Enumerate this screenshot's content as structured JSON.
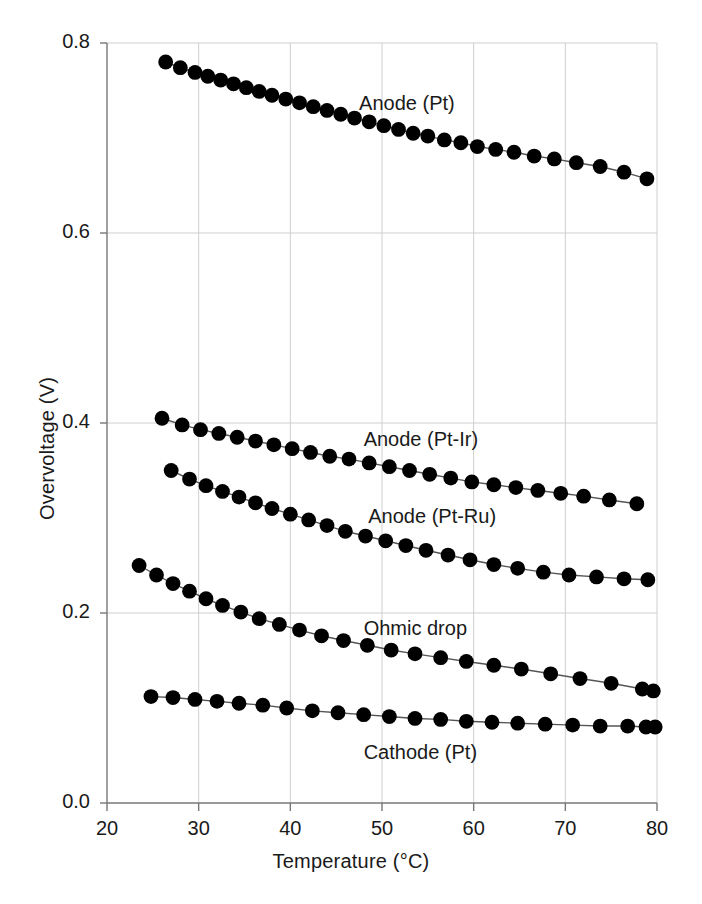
{
  "figure": {
    "background": "#ffffff",
    "marker_color": "#000000",
    "line_color": "#555555",
    "grid_color": "#cfcfcf",
    "axis_color": "#777777"
  },
  "chart_data": {
    "type": "line",
    "title": "",
    "xlabel": "Temperature (°C)",
    "ylabel": "Overvoltage (V)",
    "xlim": [
      20,
      80
    ],
    "ylim": [
      0.0,
      0.8
    ],
    "xticks": [
      20,
      30,
      40,
      50,
      60,
      70,
      80
    ],
    "xtick_labels": [
      "20",
      "30",
      "40",
      "50",
      "60",
      "70",
      "80"
    ],
    "yticks": [
      0.0,
      0.2,
      0.4,
      0.6,
      0.8
    ],
    "ytick_labels": [
      "0.0",
      "0.2",
      "0.4",
      "0.6",
      "0.8"
    ],
    "grid": true,
    "legend": "inline-annotations",
    "marker": "filled-circle",
    "series": [
      {
        "name": "Anode (Pt)",
        "label_x": 47.5,
        "label_y": 0.735,
        "x": [
          26.4,
          28.0,
          29.6,
          31.0,
          32.4,
          33.8,
          35.2,
          36.6,
          38.0,
          39.5,
          41.0,
          42.5,
          44.0,
          45.5,
          47.0,
          48.6,
          50.2,
          51.8,
          53.4,
          55.0,
          56.8,
          58.6,
          60.4,
          62.4,
          64.4,
          66.6,
          68.8,
          71.2,
          73.8,
          76.4,
          78.9
        ],
        "y": [
          0.78,
          0.774,
          0.769,
          0.765,
          0.761,
          0.757,
          0.753,
          0.749,
          0.745,
          0.741,
          0.737,
          0.733,
          0.729,
          0.725,
          0.721,
          0.717,
          0.713,
          0.709,
          0.705,
          0.702,
          0.698,
          0.695,
          0.691,
          0.688,
          0.685,
          0.681,
          0.678,
          0.674,
          0.67,
          0.664,
          0.657
        ]
      },
      {
        "name": "Anode (Pt-Ir)",
        "label_x": 48.0,
        "label_y": 0.381,
        "x": [
          26.0,
          28.2,
          30.2,
          32.2,
          34.2,
          36.2,
          38.2,
          40.2,
          42.2,
          44.3,
          46.4,
          48.6,
          50.8,
          53.0,
          55.2,
          57.5,
          59.8,
          62.2,
          64.6,
          67.0,
          69.5,
          72.0,
          74.8,
          77.8
        ],
        "y": [
          0.405,
          0.398,
          0.393,
          0.389,
          0.385,
          0.381,
          0.377,
          0.373,
          0.369,
          0.365,
          0.362,
          0.358,
          0.354,
          0.35,
          0.346,
          0.342,
          0.338,
          0.335,
          0.332,
          0.329,
          0.326,
          0.323,
          0.319,
          0.315
        ]
      },
      {
        "name": "Anode (Pt-Ru)",
        "label_x": 48.5,
        "label_y": 0.3,
        "x": [
          27.0,
          29.0,
          30.8,
          32.6,
          34.4,
          36.2,
          38.0,
          40.0,
          42.0,
          44.0,
          46.0,
          48.2,
          50.4,
          52.6,
          54.8,
          57.2,
          59.6,
          62.2,
          64.8,
          67.6,
          70.4,
          73.4,
          76.4,
          79.0
        ],
        "y": [
          0.35,
          0.341,
          0.334,
          0.328,
          0.322,
          0.316,
          0.31,
          0.304,
          0.298,
          0.292,
          0.286,
          0.281,
          0.276,
          0.271,
          0.266,
          0.261,
          0.256,
          0.251,
          0.247,
          0.243,
          0.24,
          0.238,
          0.236,
          0.235
        ]
      },
      {
        "name": "Ohmic drop",
        "label_x": 48.0,
        "label_y": 0.182,
        "x": [
          23.5,
          25.4,
          27.2,
          29.0,
          30.8,
          32.6,
          34.6,
          36.6,
          38.8,
          41.0,
          43.4,
          45.8,
          48.4,
          51.0,
          53.6,
          56.4,
          59.2,
          62.2,
          65.2,
          68.4,
          71.6,
          75.0,
          78.4,
          79.6
        ],
        "y": [
          0.25,
          0.24,
          0.231,
          0.223,
          0.215,
          0.208,
          0.201,
          0.194,
          0.188,
          0.182,
          0.176,
          0.171,
          0.166,
          0.161,
          0.157,
          0.153,
          0.149,
          0.145,
          0.141,
          0.136,
          0.131,
          0.126,
          0.12,
          0.118
        ]
      },
      {
        "name": "Cathode (Pt)",
        "label_x": 48.0,
        "label_y": 0.052,
        "x": [
          24.8,
          27.2,
          29.6,
          32.0,
          34.4,
          37.0,
          39.6,
          42.4,
          45.2,
          48.0,
          50.8,
          53.6,
          56.4,
          59.2,
          62.0,
          64.8,
          67.8,
          70.8,
          73.8,
          76.8,
          78.8,
          79.8
        ],
        "y": [
          0.112,
          0.111,
          0.109,
          0.107,
          0.105,
          0.103,
          0.1,
          0.097,
          0.095,
          0.093,
          0.091,
          0.089,
          0.088,
          0.086,
          0.085,
          0.084,
          0.083,
          0.082,
          0.081,
          0.081,
          0.08,
          0.08
        ]
      }
    ]
  }
}
